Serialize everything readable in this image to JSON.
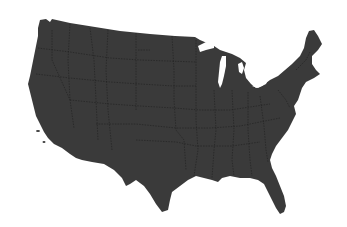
{
  "map": {
    "subject": "Contiguous United States silhouette with state borders",
    "colors": {
      "background": "#ffffff",
      "land": "#3a3a3a",
      "borders": "#1e1e1e"
    },
    "features": [
      "great-lakes",
      "florida-peninsula",
      "texas-gulf-coast",
      "new-england",
      "pacific-coast"
    ]
  }
}
